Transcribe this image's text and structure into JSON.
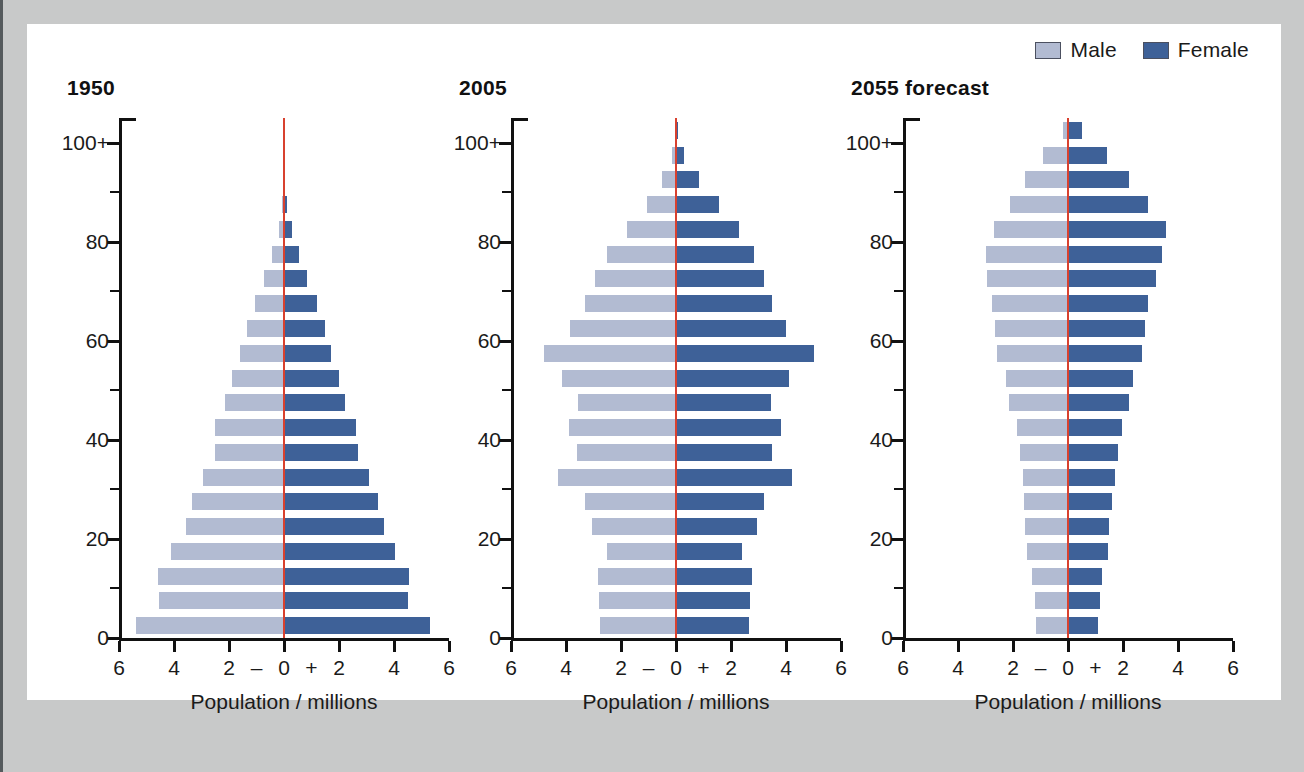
{
  "legend": {
    "items": [
      {
        "label": "Male",
        "color": "#b2bbd2",
        "name": "male"
      },
      {
        "label": "Female",
        "color": "#3e6198",
        "name": "female"
      }
    ]
  },
  "axis": {
    "y_labels": [
      "0",
      "20",
      "40",
      "60",
      "80",
      "100+"
    ],
    "x_labels": [
      "6",
      "4",
      "2",
      "0",
      "2",
      "4",
      "6"
    ],
    "x_sign_minus": "–",
    "x_sign_plus": "+",
    "x_title": "Population / millions",
    "xlim": [
      -6,
      6
    ],
    "ylim": [
      0,
      105
    ]
  },
  "chart_data": [
    {
      "type": "bar",
      "title": "1950",
      "xlabel": "Population / millions",
      "ylabel": "Age / years",
      "xlim": [
        -6,
        6
      ],
      "ylim": [
        0,
        105
      ],
      "grid": false,
      "legend_position": "top-right",
      "categories": [
        "0-4",
        "5-9",
        "10-14",
        "15-19",
        "20-24",
        "25-29",
        "30-34",
        "35-39",
        "40-44",
        "45-49",
        "50-54",
        "55-59",
        "60-64",
        "65-69",
        "70-74",
        "75-79",
        "80-84",
        "85-89",
        "90-94",
        "95-99",
        "100+"
      ],
      "series": [
        {
          "name": "Male",
          "values": [
            5.4,
            4.55,
            4.6,
            4.1,
            3.55,
            3.35,
            2.95,
            2.5,
            2.5,
            2.15,
            1.9,
            1.6,
            1.35,
            1.05,
            0.72,
            0.45,
            0.2,
            0.08,
            0.03,
            0.01,
            0.0
          ]
        },
        {
          "name": "Female",
          "values": [
            5.3,
            4.5,
            4.55,
            4.05,
            3.65,
            3.4,
            3.1,
            2.7,
            2.6,
            2.2,
            2.0,
            1.7,
            1.5,
            1.2,
            0.85,
            0.55,
            0.28,
            0.1,
            0.04,
            0.01,
            0.0
          ]
        }
      ]
    },
    {
      "type": "bar",
      "title": "2005",
      "xlabel": "Population / millions",
      "ylabel": "Age / years",
      "xlim": [
        -6,
        6
      ],
      "ylim": [
        0,
        105
      ],
      "grid": false,
      "legend_position": "top-right",
      "categories": [
        "0-4",
        "5-9",
        "10-14",
        "15-19",
        "20-24",
        "25-29",
        "30-34",
        "35-39",
        "40-44",
        "45-49",
        "50-54",
        "55-59",
        "60-64",
        "65-69",
        "70-74",
        "75-79",
        "80-84",
        "85-89",
        "90-94",
        "95-99",
        "100+"
      ],
      "series": [
        {
          "name": "Male",
          "values": [
            2.75,
            2.8,
            2.85,
            2.5,
            3.05,
            3.3,
            4.3,
            3.6,
            3.9,
            3.55,
            4.15,
            4.8,
            3.85,
            3.3,
            2.95,
            2.5,
            1.8,
            1.05,
            0.5,
            0.15,
            0.03
          ]
        },
        {
          "name": "Female",
          "values": [
            2.65,
            2.7,
            2.75,
            2.4,
            2.95,
            3.2,
            4.2,
            3.5,
            3.8,
            3.45,
            4.1,
            5.0,
            4.0,
            3.5,
            3.2,
            2.85,
            2.3,
            1.55,
            0.85,
            0.3,
            0.06
          ]
        }
      ]
    },
    {
      "type": "bar",
      "title": "2055 forecast",
      "xlabel": "Population / millions",
      "ylabel": "Age / years",
      "xlim": [
        -6,
        6
      ],
      "ylim": [
        0,
        105
      ],
      "grid": false,
      "legend_position": "top-right",
      "categories": [
        "0-4",
        "5-9",
        "10-14",
        "15-19",
        "20-24",
        "25-29",
        "30-34",
        "35-39",
        "40-44",
        "45-49",
        "50-54",
        "55-59",
        "60-64",
        "65-69",
        "70-74",
        "75-79",
        "80-84",
        "85-89",
        "90-94",
        "95-99",
        "100+"
      ],
      "series": [
        {
          "name": "Male",
          "values": [
            1.15,
            1.2,
            1.3,
            1.5,
            1.55,
            1.6,
            1.65,
            1.75,
            1.85,
            2.15,
            2.25,
            2.6,
            2.65,
            2.75,
            2.95,
            3.0,
            2.7,
            2.1,
            1.55,
            0.9,
            0.2
          ]
        },
        {
          "name": "Female",
          "values": [
            1.1,
            1.15,
            1.25,
            1.45,
            1.5,
            1.6,
            1.7,
            1.8,
            1.95,
            2.2,
            2.35,
            2.7,
            2.8,
            2.9,
            3.2,
            3.4,
            3.55,
            2.9,
            2.2,
            1.4,
            0.5
          ]
        }
      ]
    }
  ]
}
